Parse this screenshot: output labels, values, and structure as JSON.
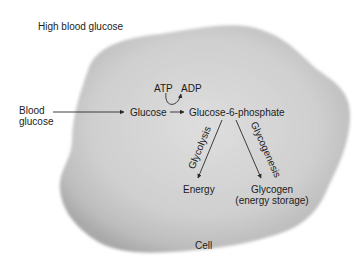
{
  "diagram": {
    "context_label": "High blood glucose",
    "cell_label": "Cell",
    "input_label_line1": "Blood",
    "input_label_line2": "glucose",
    "nodes": {
      "glucose": "Glucose",
      "g6p": "Glucose-6-phosphate",
      "atp": "ATP",
      "adp": "ADP",
      "energy": "Energy",
      "glycogen_line1": "Glycogen",
      "glycogen_line2": "(energy storage)"
    },
    "pathways": {
      "glycolysis": "Glycolysis",
      "glycogenesis": "Glycogenesis"
    },
    "edges": [
      {
        "from": "Blood glucose",
        "to": "Glucose"
      },
      {
        "from": "Glucose",
        "to": "Glucose-6-phosphate",
        "cofactor": "ATP → ADP"
      },
      {
        "from": "Glucose-6-phosphate",
        "to": "Energy",
        "label": "Glycolysis"
      },
      {
        "from": "Glucose-6-phosphate",
        "to": "Glycogen (energy storage)",
        "label": "Glycogenesis"
      }
    ],
    "colors": {
      "background": "#ffffff",
      "cell_fill": "#c8c8c8",
      "cell_center": "#dcdcdc",
      "cell_edge": "#a8a8a8",
      "text": "#1c1c1c",
      "arrow": "#2a2a2a"
    }
  }
}
